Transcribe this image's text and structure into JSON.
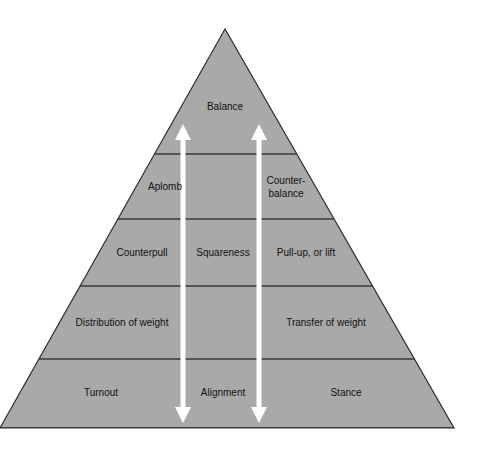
{
  "diagram": {
    "type": "pyramid",
    "colors": {
      "fill": "#a9a9a9",
      "band_line": "#3a3a3a",
      "outline": "#2e2e2e",
      "arrow": "#ffffff",
      "text": "#111111"
    },
    "geometry": {
      "apex": [
        225,
        29
      ],
      "base_left": [
        0,
        428
      ],
      "base_right": [
        454,
        428
      ],
      "band_lines_y": [
        154,
        219,
        286,
        359
      ],
      "divider_columns_x": [
        183,
        259
      ],
      "divider_width": 5,
      "arrow_top_y": 124,
      "arrow_bottom_y": 423
    },
    "tiers": [
      {
        "name": "tier-1-top",
        "cells": [
          {
            "text": "Balance",
            "x": 225,
            "y": 106
          }
        ]
      },
      {
        "name": "tier-2",
        "cells": [
          {
            "text": "Aplomb",
            "x": 165,
            "y": 186
          },
          {
            "text": "Counter-\nbalance",
            "lines": [
              "Counter-",
              "balance"
            ],
            "x": 286,
            "y": 186
          }
        ]
      },
      {
        "name": "tier-3",
        "cells": [
          {
            "text": "Counterpull",
            "x": 142,
            "y": 252
          },
          {
            "text": "Squareness",
            "x": 223,
            "y": 252
          },
          {
            "text": "Pull-up, or lift",
            "x": 306,
            "y": 252
          }
        ]
      },
      {
        "name": "tier-4",
        "cells": [
          {
            "text": "Distribution of weight",
            "x": 122,
            "y": 322
          },
          {
            "text": "Transfer of weight",
            "x": 326,
            "y": 322
          }
        ]
      },
      {
        "name": "tier-5-base",
        "cells": [
          {
            "text": "Turnout",
            "x": 101,
            "y": 392
          },
          {
            "text": "Alignment",
            "x": 223,
            "y": 392
          },
          {
            "text": "Stance",
            "x": 346,
            "y": 392
          }
        ]
      }
    ],
    "arrows": [
      {
        "name": "left-double-arrow",
        "x": 183,
        "direction": "bidirectional-vertical"
      },
      {
        "name": "right-double-arrow",
        "x": 259,
        "direction": "bidirectional-vertical"
      }
    ]
  },
  "labels": {
    "balance": "Balance",
    "aplomb": "Aplomb",
    "counterbalance_1": "Counter-",
    "counterbalance_2": "balance",
    "counterpull": "Counterpull",
    "squareness": "Squareness",
    "pullup": "Pull-up, or lift",
    "distribution": "Distribution of weight",
    "transfer": "Transfer of weight",
    "turnout": "Turnout",
    "alignment": "Alignment",
    "stance": "Stance"
  }
}
